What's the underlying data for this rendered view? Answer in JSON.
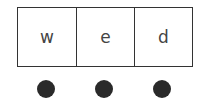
{
  "letters": [
    "w",
    "e",
    "d"
  ],
  "dots": 3,
  "colors": {
    "border": "#333333",
    "dot": "#2a2a2a",
    "text": "#444444"
  }
}
